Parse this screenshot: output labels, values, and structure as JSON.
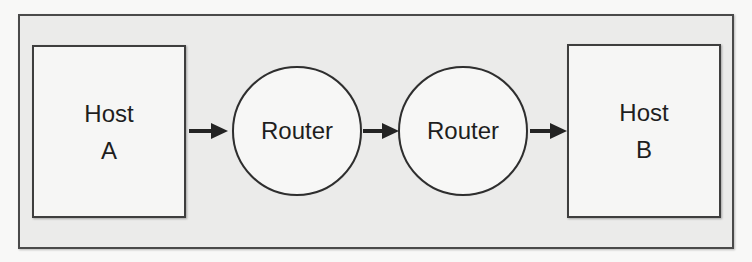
{
  "diagram": {
    "type": "network-path",
    "colors": {
      "page_background": "#f8f8f7",
      "frame_background": "#ebebea",
      "node_fill": "#f6f6f5",
      "stroke": "#3e3e3e",
      "text": "#1e1e1e"
    },
    "nodes": [
      {
        "id": "host_a",
        "shape": "rectangle",
        "lines": [
          "Host",
          "A"
        ]
      },
      {
        "id": "router_1",
        "shape": "circle",
        "label": "Router"
      },
      {
        "id": "router_2",
        "shape": "circle",
        "label": "Router"
      },
      {
        "id": "host_b",
        "shape": "rectangle",
        "lines": [
          "Host",
          "B"
        ]
      }
    ],
    "edges": [
      {
        "from": "host_a",
        "to": "router_1",
        "style": "arrow"
      },
      {
        "from": "router_1",
        "to": "router_2",
        "style": "arrow"
      },
      {
        "from": "router_2",
        "to": "host_b",
        "style": "arrow"
      }
    ]
  }
}
